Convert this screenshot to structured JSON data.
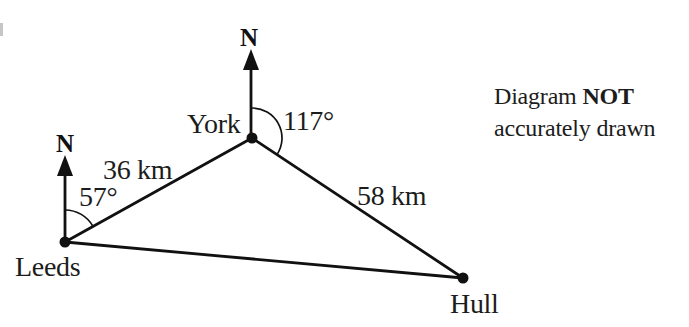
{
  "diagram": {
    "title_note": {
      "line1_normal": "Diagram",
      "line1_bold": "NOT",
      "line2": "accurately drawn"
    },
    "places": {
      "leeds": {
        "label": "Leeds"
      },
      "york": {
        "label": "York"
      },
      "hull": {
        "label": "Hull"
      }
    },
    "north_markers": {
      "leeds": "N",
      "york": "N"
    },
    "distances": {
      "leeds_to_york": "36 km",
      "york_to_hull": "58 km"
    },
    "bearings": {
      "at_leeds": "57°",
      "at_york": "117°"
    },
    "colors": {
      "ink": "#1c1c1c",
      "line": "#111111",
      "background": "#ffffff"
    }
  }
}
